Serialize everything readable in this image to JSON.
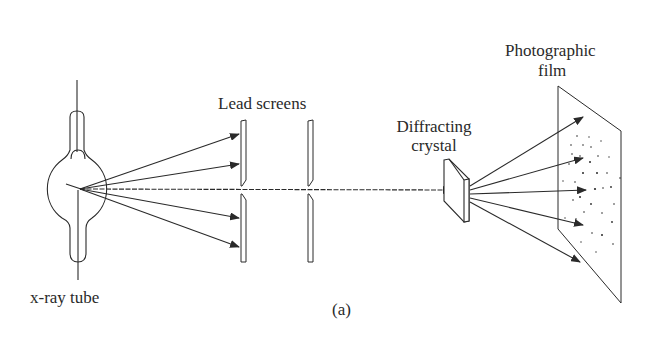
{
  "figure": {
    "caption": "(a)",
    "ink_color": "#2a2a2a",
    "background": "#ffffff"
  },
  "labels": {
    "xray_tube": "x-ray tube",
    "lead_screens": "Lead screens",
    "diffracting_crystal_line1": "Diffracting",
    "diffracting_crystal_line2": "crystal",
    "photographic_film_line1": "Photographic",
    "photographic_film_line2": "film"
  },
  "components": [
    {
      "id": "xray-tube",
      "label": "x-ray tube"
    },
    {
      "id": "lead-screens",
      "label": "Lead screens",
      "count": 2
    },
    {
      "id": "diffracting-crystal",
      "label": "Diffracting crystal"
    },
    {
      "id": "photographic-film",
      "label": "Photographic film"
    }
  ],
  "rays": {
    "source_to_screen_count": 4,
    "transmitted_beam": 1,
    "diffracted_count": 5
  }
}
